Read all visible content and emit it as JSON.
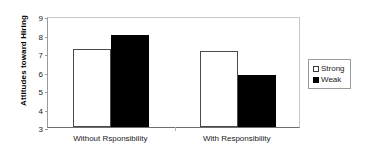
{
  "chart_data": {
    "type": "bar",
    "title": "",
    "xlabel": "",
    "ylabel": "Attitudes toward Hiring",
    "categories": [
      "Without Rsponsibility",
      "With Responsibility"
    ],
    "series": [
      {
        "name": "Strong",
        "values": [
          7.2,
          7.1
        ],
        "color": "#ffffff"
      },
      {
        "name": "Weak",
        "values": [
          8.0,
          5.8
        ],
        "color": "#000000"
      }
    ],
    "ylim": [
      3,
      9
    ],
    "yticks": [
      9,
      8,
      7,
      6,
      5,
      4,
      3
    ],
    "grid": false,
    "legend_position": "right"
  },
  "notes": {
    "series_by_group": {
      "without_responsibility": {
        "strong": 7.2,
        "weak": 7.1
      },
      "with_responsibility": {
        "strong": 8.0,
        "weak": 5.8
      }
    }
  },
  "legend": {
    "items": [
      {
        "label": "Strong",
        "marker": "open-square"
      },
      {
        "label": "Weak",
        "marker": "filled-square"
      }
    ]
  }
}
